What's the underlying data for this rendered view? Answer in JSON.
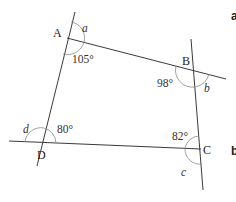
{
  "diagram": {
    "vertices": {
      "A": "A",
      "B": "B",
      "C": "C",
      "D": "D"
    },
    "angles": {
      "A_interior": "105°",
      "B_interior": "98°",
      "C_interior": "82°",
      "D_interior": "80°"
    },
    "unknowns": {
      "a": "a",
      "b": "b",
      "c": "c",
      "d": "d"
    },
    "part_labels": {
      "first": "a",
      "second": "b"
    }
  }
}
